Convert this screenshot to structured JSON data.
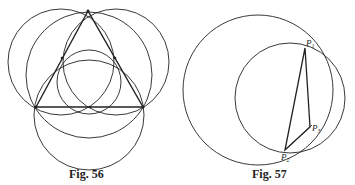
{
  "figures": [
    {
      "caption": "Fig. 56",
      "description": "Equilateral triangle with circles through its vertices and side midpoints"
    },
    {
      "caption": "Fig. 57",
      "description": "Two intersecting circles with triangle P1 P2 P3",
      "points": [
        {
          "label": "P",
          "sub": "1"
        },
        {
          "label": "P",
          "sub": "2"
        },
        {
          "label": "P",
          "sub": "3"
        }
      ]
    }
  ],
  "colors": {
    "stroke": "#222222",
    "background": "#ffffff"
  }
}
